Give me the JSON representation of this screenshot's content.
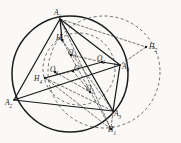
{
  "figure": {
    "background_color": "#faf9f7",
    "stroke_color": "#1a1a1a",
    "dashed_color": "#4a4a4a"
  },
  "circles": [
    {
      "name": "main-circumcircle",
      "style": "solid",
      "cx": 70,
      "cy": 74,
      "r": 58
    },
    {
      "name": "auxiliary-dashed-circle",
      "style": "dashed",
      "cx": 104,
      "cy": 72,
      "r": 56
    },
    {
      "name": "inner-dashed-circle",
      "style": "dashed",
      "cx": 79,
      "cy": 69,
      "r": 36
    }
  ],
  "vertices": [
    {
      "label": "A",
      "sub": "1",
      "x": 60,
      "y": 19,
      "lx": 54,
      "ly": 9,
      "dot": false
    },
    {
      "label": "A",
      "sub": "2",
      "x": 14,
      "y": 100,
      "lx": 5,
      "ly": 99,
      "dot": false
    },
    {
      "label": "A",
      "sub": "3",
      "x": 113,
      "y": 111,
      "lx": 114,
      "ly": 110,
      "dot": false
    },
    {
      "label": "A",
      "sub": "4",
      "x": 120,
      "y": 65,
      "lx": 122,
      "ly": 63,
      "dot": false
    }
  ],
  "centers": [
    {
      "label": "O",
      "sub": "",
      "x": 73,
      "y": 71,
      "lx": 74,
      "ly": 65,
      "dot": true
    },
    {
      "label": "O",
      "sub": "1",
      "x": 90,
      "y": 92,
      "lx": 86,
      "ly": 85,
      "dot": true
    },
    {
      "label": "O",
      "sub": "2",
      "x": 102,
      "y": 62,
      "lx": 97,
      "ly": 55,
      "dot": true
    },
    {
      "label": "O",
      "sub": "3",
      "x": 71,
      "y": 55,
      "lx": 68,
      "ly": 49,
      "dot": true
    },
    {
      "label": "O",
      "sub": "4",
      "x": 55,
      "y": 72,
      "lx": 50,
      "ly": 66,
      "dot": true
    }
  ],
  "orthocenters": [
    {
      "label": "H",
      "sub": "1",
      "x": 111,
      "y": 129,
      "lx": 108,
      "ly": 126,
      "dot": true
    },
    {
      "label": "H",
      "sub": "2",
      "x": 146,
      "y": 47,
      "lx": 149,
      "ly": 43,
      "dot": true
    },
    {
      "label": "H",
      "sub": "3",
      "x": 62,
      "y": 40,
      "lx": 56,
      "ly": 34,
      "dot": true
    },
    {
      "label": "H",
      "sub": "4",
      "x": 45,
      "y": 78,
      "lx": 34,
      "ly": 75,
      "dot": true
    }
  ],
  "solid_segments": [
    {
      "name": "side-a1-a2",
      "x1": 60,
      "y1": 19,
      "x2": 14,
      "y2": 100
    },
    {
      "name": "side-a2-a3",
      "x1": 14,
      "y1": 100,
      "x2": 113,
      "y2": 111
    },
    {
      "name": "side-a3-a4",
      "x1": 113,
      "y1": 111,
      "x2": 120,
      "y2": 65
    },
    {
      "name": "diag-a1-a3",
      "x1": 60,
      "y1": 19,
      "x2": 113,
      "y2": 111
    },
    {
      "name": "diag-a1-a4",
      "x1": 60,
      "y1": 19,
      "x2": 120,
      "y2": 65
    },
    {
      "name": "diag-a2-a4",
      "x1": 14,
      "y1": 100,
      "x2": 120,
      "y2": 65
    },
    {
      "name": "seg-a1-h3",
      "x1": 60,
      "y1": 19,
      "x2": 62,
      "y2": 40
    },
    {
      "name": "seg-h4-o2",
      "x1": 45,
      "y1": 78,
      "x2": 102,
      "y2": 62
    },
    {
      "name": "seg-o2-a4",
      "x1": 102,
      "y1": 62,
      "x2": 120,
      "y2": 65
    }
  ],
  "dashed_segments": [
    {
      "name": "ray-a1-h2",
      "x1": 60,
      "y1": 19,
      "x2": 146,
      "y2": 47
    },
    {
      "name": "ray-a1-h1",
      "x1": 60,
      "y1": 19,
      "x2": 111,
      "y2": 129
    },
    {
      "name": "ray-h3-h1",
      "x1": 62,
      "y1": 40,
      "x2": 111,
      "y2": 129
    },
    {
      "name": "ray-h3-a3",
      "x1": 62,
      "y1": 40,
      "x2": 113,
      "y2": 111
    },
    {
      "name": "ray-h4-h1",
      "x1": 45,
      "y1": 78,
      "x2": 111,
      "y2": 129
    },
    {
      "name": "ray-h4-a3",
      "x1": 45,
      "y1": 78,
      "x2": 113,
      "y2": 111
    },
    {
      "name": "ray-o4-o1",
      "x1": 55,
      "y1": 72,
      "x2": 90,
      "y2": 92
    },
    {
      "name": "ray-o3-o2",
      "x1": 71,
      "y1": 55,
      "x2": 102,
      "y2": 62
    },
    {
      "name": "ray-o-o1",
      "x1": 73,
      "y1": 71,
      "x2": 90,
      "y2": 92
    },
    {
      "name": "ray-h2-a4",
      "x1": 146,
      "y1": 47,
      "x2": 120,
      "y2": 65
    },
    {
      "name": "ray-a3-h1",
      "x1": 113,
      "y1": 111,
      "x2": 111,
      "y2": 129
    },
    {
      "name": "ray-h4-o",
      "x1": 45,
      "y1": 78,
      "x2": 73,
      "y2": 71
    }
  ]
}
